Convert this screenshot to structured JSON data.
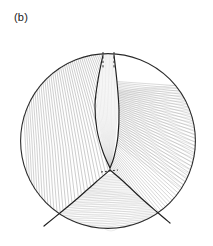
{
  "figure": {
    "panel_label": "(b)",
    "kind": "caustic-ray-diagram",
    "background_color": "#ffffff",
    "ink_color": "#1a1a1a"
  },
  "chart_data": {
    "type": "scatter",
    "title": "(b)",
    "subtitle": "",
    "xlabel": "",
    "ylabel": "",
    "grid": false,
    "legend": null,
    "axis_visible": false,
    "xlim": [
      -1,
      1
    ],
    "ylim": [
      -1,
      1
    ],
    "boundary": {
      "name": "unit-circle",
      "shape": "circle",
      "center_px": [
        108,
        141
      ],
      "radius_px": 88,
      "stroke": "#2b2b2b",
      "stroke_width_px": 1.1
    },
    "ray_families": [
      {
        "name": "left-fan",
        "count": 46,
        "color": "#8a8a8a",
        "width_px": 0.55,
        "description": "near-vertical rays filling the left half, slightly converging toward the lower-centre cusp"
      },
      {
        "name": "right-fan",
        "count": 52,
        "color": "#9a9a9a",
        "width_px": 0.55,
        "description": "diagonal rays sweeping from upper-left to lower-right across the right half"
      },
      {
        "name": "lower-lobe",
        "count": 34,
        "color": "#a8a8a8",
        "width_px": 0.5,
        "description": "shallow near-horizontal rays inside the lower triangular lobe"
      },
      {
        "name": "upper-lens-interior",
        "count": 16,
        "color": "#b4b4b4",
        "width_px": 0.45,
        "description": "faint rays inside the narrow vertical lens above the cusp"
      }
    ],
    "caustic_curves": [
      {
        "name": "lens-left-branch",
        "style": "solid",
        "color": "#1f1f1f",
        "width_px": 1.15,
        "points_px": [
          [
            103,
            55
          ],
          [
            98,
            80
          ],
          [
            95,
            105
          ],
          [
            97,
            130
          ],
          [
            103,
            152
          ],
          [
            110,
            168
          ]
        ]
      },
      {
        "name": "lens-right-branch",
        "style": "solid",
        "color": "#1f1f1f",
        "width_px": 1.15,
        "points_px": [
          [
            114,
            55
          ],
          [
            117,
            82
          ],
          [
            119,
            110
          ],
          [
            118,
            136
          ],
          [
            114,
            157
          ],
          [
            110,
            168
          ]
        ]
      },
      {
        "name": "lobe-left-branch",
        "style": "solid",
        "color": "#1f1f1f",
        "width_px": 1.2,
        "points_px": [
          [
            110,
            170
          ],
          [
            96,
            182
          ],
          [
            78,
            198
          ],
          [
            60,
            213
          ],
          [
            44,
            226
          ]
        ]
      },
      {
        "name": "lobe-right-branch",
        "style": "solid",
        "color": "#1f1f1f",
        "width_px": 1.2,
        "points_px": [
          [
            110,
            170
          ],
          [
            124,
            182
          ],
          [
            141,
            198
          ],
          [
            157,
            212
          ],
          [
            170,
            223
          ]
        ]
      }
    ],
    "dashed_segments": [
      {
        "name": "top-dash-left",
        "x_px": 103,
        "y0_px": 52,
        "y1_px": 68,
        "color": "#2b2b2b",
        "dash": "2.2 2.2"
      },
      {
        "name": "top-dash-right",
        "x_px": 114,
        "y0_px": 52,
        "y1_px": 68,
        "color": "#2b2b2b",
        "dash": "2.2 2.2"
      },
      {
        "name": "cusp-dash",
        "x0_px": 101,
        "y0_px": 172,
        "x1_px": 118,
        "y1_px": 170,
        "color": "#2b2b2b",
        "dash": "2.0 2.0"
      }
    ],
    "cusp_point_px": [
      110,
      169
    ],
    "annotations": []
  }
}
